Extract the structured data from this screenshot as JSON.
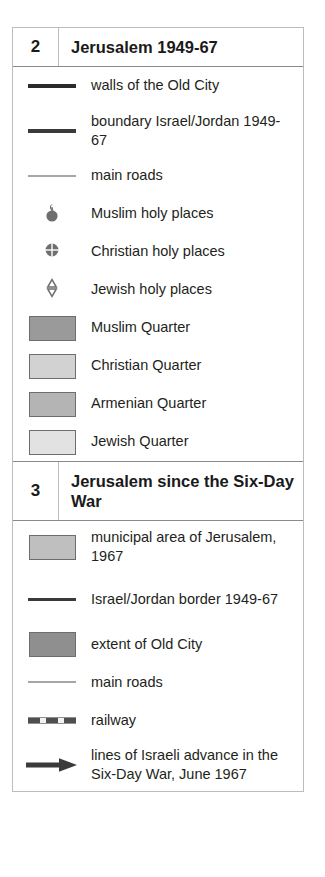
{
  "panel": {
    "name": "map-legend-panel",
    "border_color": "#bcbcbc"
  },
  "sections": [
    {
      "number": "2",
      "title": "Jerusalem 1949-67",
      "entries": [
        {
          "symbol": "line-thick",
          "label": "walls of the Old City",
          "color": "#2b2b2b"
        },
        {
          "symbol": "line-medium",
          "label": "boundary Israel/Jordan 1949-67",
          "color": "#3a3a3a"
        },
        {
          "symbol": "line-thin",
          "label": "main roads",
          "color": "#a6a6a6"
        },
        {
          "symbol": "muslim-holy-place-icon",
          "label": "Muslim holy places",
          "color": "#6e6e6e"
        },
        {
          "symbol": "christian-holy-place-icon",
          "label": "Christian holy places",
          "color": "#6e6e6e"
        },
        {
          "symbol": "jewish-holy-place-icon",
          "label": "Jewish holy places",
          "color": "#6e6e6e"
        },
        {
          "symbol": "swatch",
          "label": "Muslim Quarter",
          "color": "#9a9a9a",
          "border": "#6d6d6d"
        },
        {
          "symbol": "swatch",
          "label": "Christian Quarter",
          "color": "#d2d2d2",
          "border": "#6d6d6d"
        },
        {
          "symbol": "swatch",
          "label": "Armenian Quarter",
          "color": "#b4b4b4",
          "border": "#6d6d6d"
        },
        {
          "symbol": "swatch",
          "label": "Jewish Quarter",
          "color": "#e2e2e2",
          "border": "#6d6d6d"
        }
      ]
    },
    {
      "number": "3",
      "title": "Jerusalem since the Six-Day War",
      "entries": [
        {
          "symbol": "swatch",
          "label": "municipal area of Jerusalem, 1967",
          "color": "#bfbfbf",
          "border": "#6d6d6d"
        },
        {
          "symbol": "line-medium",
          "label": "Israel/Jordan border 1949-67",
          "color": "#3a3a3a"
        },
        {
          "symbol": "swatch",
          "label": "extent of Old City",
          "color": "#8f8f8f",
          "border": "#6d6d6d"
        },
        {
          "symbol": "line-thin",
          "label": "main roads",
          "color": "#a6a6a6"
        },
        {
          "symbol": "railway-icon",
          "label": "railway",
          "color": "#4f4f4f"
        },
        {
          "symbol": "arrow-icon",
          "label": "lines of Israeli advance in the Six-Day War, June 1967",
          "color": "#3a3a3a"
        }
      ]
    }
  ]
}
